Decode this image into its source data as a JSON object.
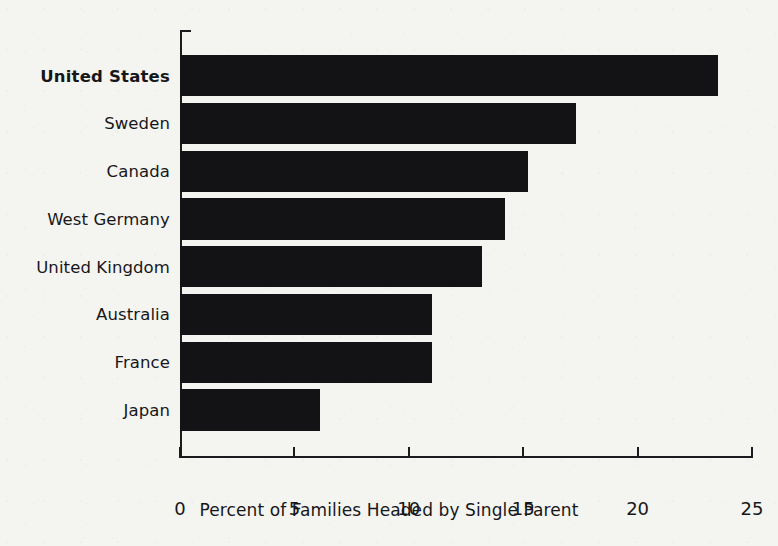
{
  "chart_data": {
    "type": "bar",
    "orientation": "horizontal",
    "title": "",
    "xlabel": "Percent of Families Headed by Single Parent",
    "ylabel": "",
    "xlim": [
      0,
      25
    ],
    "xticks": [
      0,
      5,
      10,
      15,
      20,
      25
    ],
    "xtick_labels": [
      "0",
      "5",
      "10",
      "15",
      "20",
      "25"
    ],
    "grid": false,
    "legend": false,
    "bar_color": "#131316",
    "background_color": "#f4f4f1",
    "categories": [
      "United States",
      "Sweden",
      "Canada",
      "West Germany",
      "United Kingdom",
      "Australia",
      "France",
      "Japan"
    ],
    "values": [
      23.5,
      17.3,
      15.2,
      14.2,
      13.2,
      11.0,
      11.0,
      6.1
    ],
    "highlighted_category": "United States",
    "series": [
      {
        "name": "Percent of Families Headed by Single Parent",
        "values": [
          23.5,
          17.3,
          15.2,
          14.2,
          13.2,
          11.0,
          11.0,
          6.1
        ]
      }
    ]
  },
  "axis": {
    "x_title": "Percent of Families Headed by Single Parent"
  }
}
